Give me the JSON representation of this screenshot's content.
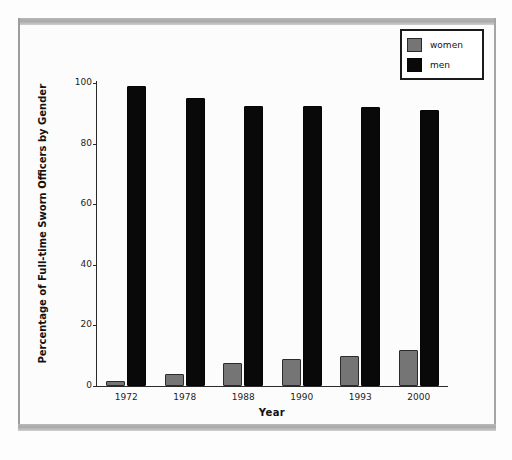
{
  "chart_data": {
    "type": "bar",
    "title": "",
    "xlabel": "Year",
    "ylabel": "Percentage of Full-time Sworn Officers by Gender",
    "categories": [
      "1972",
      "1978",
      "1988",
      "1990",
      "1993",
      "2000"
    ],
    "series": [
      {
        "name": "women",
        "color": "#757575",
        "values": [
          1.5,
          4,
          7.5,
          9,
          9.8,
          12
        ]
      },
      {
        "name": "men",
        "color": "#090909",
        "values": [
          99,
          95,
          92.5,
          92.5,
          92,
          91
        ]
      }
    ],
    "ylim": [
      0,
      100
    ],
    "yticks": [
      0,
      20,
      40,
      60,
      80,
      100
    ],
    "ytick_labels": [
      "0",
      "20",
      "40",
      "60",
      "80",
      "100"
    ],
    "grid": false,
    "legend_position": "top-right",
    "legend_entries": [
      "women",
      "men"
    ]
  },
  "axes": {
    "y_title": "Percentage of Full-time Sworn Officers by Gender",
    "x_title": "Year"
  },
  "legend": {
    "women_label": "women",
    "men_label": "men"
  },
  "colors": {
    "women": "#757575",
    "men": "#090909",
    "axis": "#2a2a2a",
    "page_background": "#fdfdfd",
    "scan_band": "#b0b0b0"
  }
}
